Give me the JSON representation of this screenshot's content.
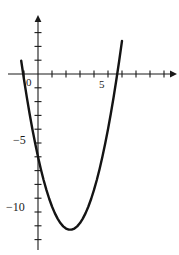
{
  "figure": {
    "kind": "cartesian-plot",
    "background_color": "#ffffff",
    "axis_color": "#1a1a1a",
    "curve_color": "#141414",
    "width_px": 179,
    "height_px": 255
  },
  "axes": {
    "x_axis_name": "x-axis",
    "y_axis_name": "y-axis",
    "x_tick_labels": [
      "0",
      "5"
    ],
    "y_tick_labels": [
      "−5",
      "−10"
    ],
    "x_label_zero": "0",
    "x_label_five": "5",
    "y_label_neg5": "−5",
    "y_label_neg10": "−10"
  },
  "chart_data": {
    "type": "line",
    "title": "",
    "subtitle": "",
    "xlabel": "",
    "ylabel": "",
    "grid": false,
    "legend": null,
    "xlim": [
      -1.8,
      9.6
    ],
    "ylim": [
      -13.2,
      4.2
    ],
    "x_ticks": [
      -1,
      0,
      1,
      2,
      3,
      4,
      5,
      6,
      7,
      8,
      9
    ],
    "x_tick_labels_shown": {
      "0": "0",
      "5": "5"
    },
    "y_ticks": [
      -13,
      -12,
      -11,
      -10,
      -9,
      -8,
      -7,
      -6,
      -5,
      -4,
      -3,
      -2,
      -1,
      0,
      1,
      2,
      3,
      4
    ],
    "y_tick_labels_shown": {
      "-5": "−5",
      "-10": "−10"
    },
    "annotations": [],
    "series": [
      {
        "name": "parabola",
        "equation": "y = x^2 - 4.6x - 6",
        "vertex": [
          2.3,
          -11.29
        ],
        "y_intercept": -6,
        "x_intercepts": [
          -1.04,
          5.64
        ],
        "x": [
          -1.2,
          -1.0,
          -0.8,
          -0.6,
          -0.4,
          -0.2,
          0.0,
          0.2,
          0.4,
          0.6,
          0.8,
          1.0,
          1.2,
          1.4,
          1.6,
          1.8,
          2.0,
          2.2,
          2.4,
          2.6,
          2.8,
          3.0,
          3.2,
          3.4,
          3.6,
          3.8,
          4.0,
          4.2,
          4.4,
          4.6,
          4.8,
          5.0,
          5.2,
          5.4,
          5.6,
          5.8,
          6.0
        ],
        "y": [
          0.96,
          -0.4,
          -1.68,
          -2.88,
          -4.0,
          -5.04,
          -6.0,
          -6.88,
          -7.68,
          -8.4,
          -9.04,
          -9.6,
          -10.08,
          -10.48,
          -10.8,
          -11.04,
          -11.2,
          -11.28,
          -11.28,
          -11.2,
          -11.04,
          -10.8,
          -10.48,
          -10.08,
          -9.6,
          -9.04,
          -8.4,
          -7.68,
          -6.88,
          -6.0,
          -5.04,
          -4.0,
          -2.88,
          -1.68,
          -0.4,
          0.96,
          2.4
        ]
      }
    ]
  }
}
